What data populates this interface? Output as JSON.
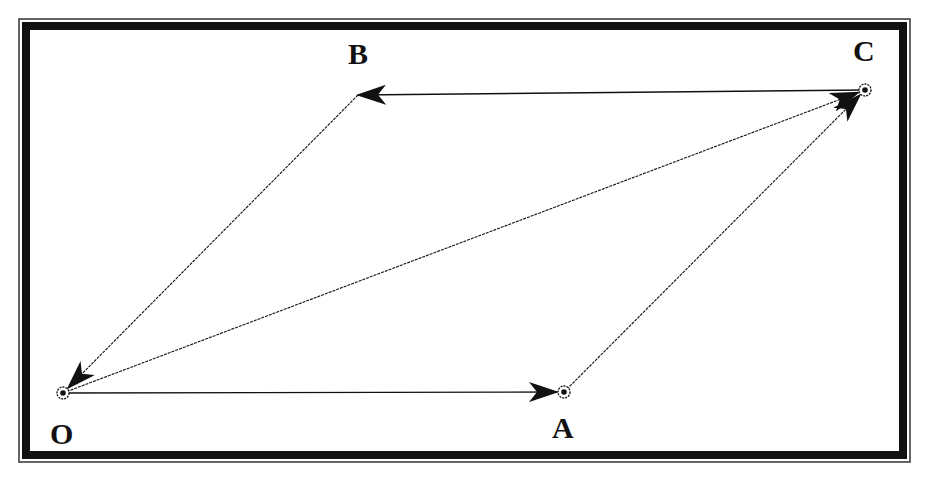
{
  "diagram": {
    "type": "vector-parallelogram",
    "colors": {
      "ink": "#111111",
      "background": "#ffffff",
      "frame": "#111111"
    },
    "points": [
      {
        "id": "O",
        "label": "O",
        "x": 63,
        "y": 393,
        "marker": "circled-dot",
        "label_x": 50,
        "label_y": 444
      },
      {
        "id": "A",
        "label": "A",
        "x": 564,
        "y": 392,
        "marker": "circled-dot",
        "label_x": 552,
        "label_y": 438
      },
      {
        "id": "C",
        "label": "C",
        "x": 865,
        "y": 90,
        "marker": "circled-dot",
        "label_x": 853,
        "label_y": 61
      },
      {
        "id": "B",
        "label": "B",
        "x": 358,
        "y": 95,
        "marker": "none",
        "label_x": 348,
        "label_y": 64
      }
    ],
    "vectors": [
      {
        "from": "O",
        "to": "A",
        "name": "vector-OA",
        "style": "solid"
      },
      {
        "from": "A",
        "to": "C",
        "name": "vector-AC",
        "style": "dotted"
      },
      {
        "from": "O",
        "to": "C",
        "name": "vector-OC",
        "style": "dotted"
      },
      {
        "from": "C",
        "to": "B",
        "name": "vector-CB",
        "style": "solid"
      },
      {
        "from": "B",
        "to": "O",
        "name": "vector-BO",
        "style": "dotted"
      }
    ]
  }
}
